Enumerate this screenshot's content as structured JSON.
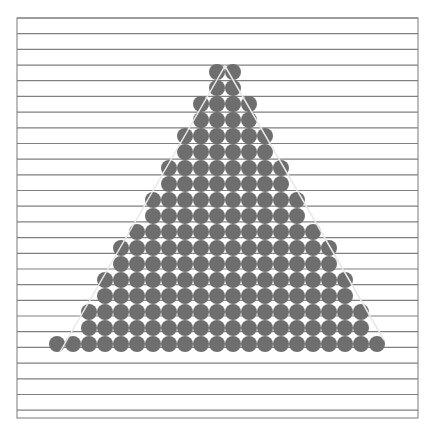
{
  "figure": {
    "colors": {
      "background": "#ffffff",
      "frame": "#7a7a7a",
      "rule_lines": "#808080",
      "circle_fill": "#6e6e6e",
      "triangle_outline": "#e8e8e8"
    },
    "frame": {
      "x": 17,
      "y": 18,
      "width": 401,
      "height": 400
    },
    "rule_line_count": 26,
    "circle": {
      "diameter": 16,
      "spacing": 16,
      "origin_x": 217
    },
    "rows": [
      {
        "y": 72,
        "kmin": 0,
        "kmax": 1
      },
      {
        "y": 88,
        "kmin": 0,
        "kmax": 1
      },
      {
        "y": 104,
        "kmin": -1,
        "kmax": 2
      },
      {
        "y": 120,
        "kmin": -1,
        "kmax": 2
      },
      {
        "y": 136,
        "kmin": -2,
        "kmax": 3
      },
      {
        "y": 152,
        "kmin": -2,
        "kmax": 3
      },
      {
        "y": 168,
        "kmin": -3,
        "kmax": 4
      },
      {
        "y": 184,
        "kmin": -3,
        "kmax": 4
      },
      {
        "y": 200,
        "kmin": -4,
        "kmax": 5
      },
      {
        "y": 216,
        "kmin": -4,
        "kmax": 5
      },
      {
        "y": 232,
        "kmin": -5,
        "kmax": 6
      },
      {
        "y": 248,
        "kmin": -6,
        "kmax": 7
      },
      {
        "y": 264,
        "kmin": -6,
        "kmax": 7
      },
      {
        "y": 280,
        "kmin": -7,
        "kmax": 8
      },
      {
        "y": 296,
        "kmin": -7,
        "kmax": 8
      },
      {
        "y": 312,
        "kmin": -8,
        "kmax": 9
      },
      {
        "y": 328,
        "kmin": -8,
        "kmax": 9
      },
      {
        "y": 344,
        "kmin": -10,
        "kmax": 10
      }
    ],
    "triangle": {
      "apex": [
        225,
        66
      ],
      "base_left": [
        60,
        352
      ],
      "base_right": [
        384,
        340
      ]
    }
  }
}
